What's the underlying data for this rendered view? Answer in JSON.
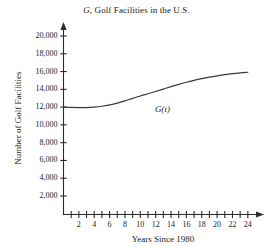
{
  "chart_data": {
    "type": "line",
    "title": "G, Golf Facilities in the U.S.",
    "title_italic_prefix": "G",
    "title_rest": ", Golf Facilities in the U.S.",
    "xlabel": "Years Since 1980",
    "ylabel": "Number of Golf Facilities",
    "series_label": "G(t)",
    "series_label_italic_var": "t",
    "grid": false,
    "legend_position": "inline-annotation",
    "xlim": [
      0,
      25
    ],
    "ylim": [
      0,
      21000
    ],
    "x_tick_labels": [
      "2",
      "4",
      "6",
      "8",
      "10",
      "12",
      "14",
      "16",
      "18",
      "20",
      "22",
      "24"
    ],
    "x_tick_values": [
      2,
      4,
      6,
      8,
      10,
      12,
      14,
      16,
      18,
      20,
      22,
      24
    ],
    "x_minor_tick_values": [
      1,
      2,
      3,
      4,
      5,
      6,
      7,
      8,
      9,
      10,
      11,
      12,
      13,
      14,
      15,
      16,
      17,
      18,
      19,
      20,
      21,
      22,
      23,
      24
    ],
    "y_tick_labels": [
      "2,000",
      "4,000",
      "6,000",
      "8,000",
      "10,000",
      "12,000",
      "14,000",
      "16,000",
      "18,000",
      "20,000"
    ],
    "y_tick_values": [
      2000,
      4000,
      6000,
      8000,
      10000,
      12000,
      14000,
      16000,
      18000,
      20000
    ],
    "x": [
      0,
      1,
      2,
      3,
      4,
      5,
      6,
      7,
      8,
      9,
      10,
      11,
      12,
      13,
      14,
      15,
      16,
      17,
      18,
      19,
      20,
      21,
      22,
      23,
      24
    ],
    "values": [
      12000,
      11960,
      11940,
      11950,
      12000,
      12100,
      12250,
      12450,
      12700,
      12980,
      13250,
      13500,
      13760,
      14030,
      14300,
      14560,
      14800,
      15010,
      15200,
      15370,
      15520,
      15650,
      15760,
      15850,
      15920
    ],
    "line_color": "#3a3a3a",
    "axis_color": "#2b2b2b",
    "background_color": "#ffffff"
  }
}
